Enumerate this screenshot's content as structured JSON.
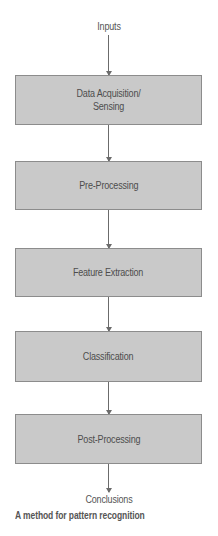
{
  "diagram": {
    "input_label": "Inputs",
    "output_label": "Conclusions",
    "caption": "A method for pattern recognition",
    "steps": [
      {
        "label": "Data Acquisition/\nSensing"
      },
      {
        "label": "Pre-Processing"
      },
      {
        "label": "Feature Extraction"
      },
      {
        "label": "Classification"
      },
      {
        "label": "Post-Processing"
      }
    ],
    "colors": {
      "box_fill": "#c9c9c9",
      "box_border": "#8c8c8c",
      "arrow": "#6b6b6b",
      "text": "#4d4d4d"
    }
  }
}
